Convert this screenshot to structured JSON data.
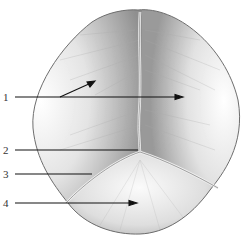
{
  "figure": {
    "colors": {
      "bone": "#dcdcdc",
      "shade": "#9a9a9a",
      "suture": "#e9e9e9",
      "leader": "#111111"
    },
    "labels": [
      {
        "num": "1",
        "x": 3,
        "y": 93
      },
      {
        "num": "2",
        "x": 3,
        "y": 146
      },
      {
        "num": "3",
        "x": 3,
        "y": 170
      },
      {
        "num": "4",
        "x": 3,
        "y": 198
      }
    ]
  }
}
